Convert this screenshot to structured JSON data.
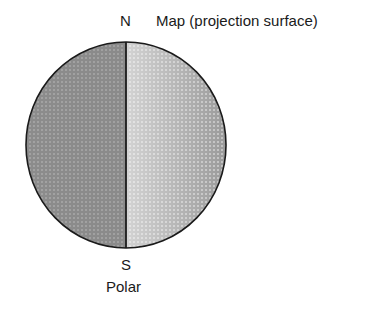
{
  "diagram": {
    "type": "polar-projection",
    "labels": {
      "north": "N",
      "south": "S",
      "surface": "Map (projection surface)",
      "caption": "Polar"
    },
    "globe": {
      "center": [
        126,
        145
      ],
      "radius_x": 100,
      "radius_y": 103,
      "outline_color": "#1a1a1a",
      "left_half_fill": "#8a8a8a",
      "right_half_fill_center": "#e6e6e6",
      "right_half_fill_edge": "#9a9a9a"
    },
    "projection_line": {
      "orientation": "vertical",
      "x": 126,
      "from": "N",
      "to": "S",
      "color": "#1a1a1a"
    }
  }
}
